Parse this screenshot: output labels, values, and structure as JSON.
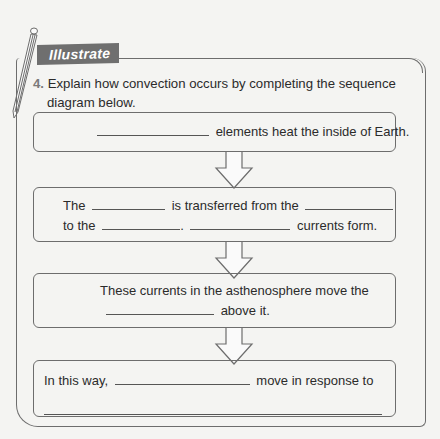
{
  "section_label": "Illustrate",
  "question": {
    "number": "4.",
    "text_line1": "Explain how convection occurs by completing the sequence",
    "text_line2": "diagram below."
  },
  "steps": [
    {
      "blank_before": "",
      "text": "elements heat the inside of Earth."
    },
    {
      "line1": {
        "t1": "The",
        "t2": "is transferred from the"
      },
      "line2": {
        "t1": "to the",
        "t2": ".",
        "t3": "currents form."
      }
    },
    {
      "line1": "These  currents in the asthenosphere move the",
      "line2": "above it."
    },
    {
      "line1": {
        "t1": "In this way,",
        "t2": "move in response to"
      }
    }
  ],
  "colors": {
    "banner": "#6f6f6f",
    "border": "#6d6d6d",
    "background": "#f4f4f2"
  }
}
